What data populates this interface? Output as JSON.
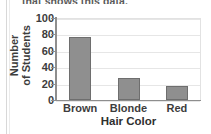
{
  "worksheet": {
    "prompt_line": "that shows this data."
  },
  "chart_data": {
    "type": "bar",
    "title": "",
    "categories": [
      "Brown",
      "Blonde",
      "Red"
    ],
    "values": [
      77,
      27,
      17
    ],
    "xlabel": "Hair Color",
    "ylabel_line1": "Number",
    "ylabel_line2": "of Students",
    "ylim": [
      0,
      100
    ],
    "yticks": [
      0,
      20,
      40,
      60,
      80,
      100
    ],
    "ytick_labels": [
      "0",
      "20",
      "40",
      "60",
      "80",
      "100"
    ],
    "grid": true,
    "legend": "none",
    "bar_color": "#8f8f8f",
    "bar_edge_color": "#6e6e6e",
    "axis_color": "#8e8e8e",
    "grid_color": "#e6e6e6"
  }
}
